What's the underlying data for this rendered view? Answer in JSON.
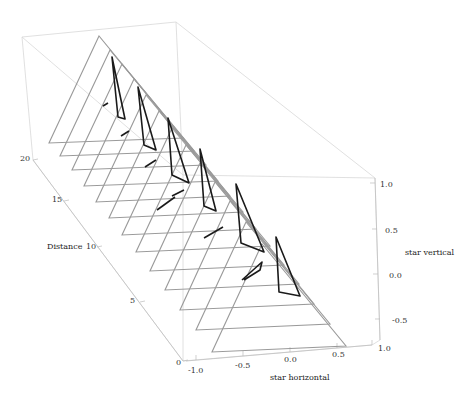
{
  "chart_data": {
    "type": "3d-line",
    "title": "",
    "axes": {
      "x": {
        "label": "star horizontal",
        "range": [
          -1.0,
          1.0
        ],
        "ticks": [
          "-1.0",
          "-0.5",
          "0.0",
          "0.5",
          "1.0"
        ]
      },
      "y": {
        "label": "Distance",
        "range": [
          0,
          20
        ],
        "ticks": [
          "0",
          "5",
          "10",
          "15",
          "20"
        ]
      },
      "z": {
        "label": "star vertical",
        "range": [
          -0.75,
          1.0
        ],
        "ticks": [
          "-0.5",
          "0.0",
          "0.5",
          "1.0"
        ]
      }
    },
    "series": [
      {
        "name": "reference triangles (gray)",
        "count": 12,
        "shape": "equilateral triangle",
        "distance_range": [
          1,
          20
        ]
      },
      {
        "name": "star paths (black)",
        "count": 6,
        "shape": "thin triangular loops with short tick segments"
      }
    ],
    "box": true,
    "grid": false,
    "legend": "none"
  },
  "labels": {
    "distance_axis": "Distance",
    "horizontal_axis": "star horizontal",
    "vertical_axis": "star vertical",
    "distance_ticks": [
      {
        "text": "20",
        "x": 20,
        "y": 154
      },
      {
        "text": "15",
        "x": 52,
        "y": 195
      },
      {
        "text": "10",
        "x": 86,
        "y": 242
      },
      {
        "text": "5",
        "x": 130,
        "y": 296
      },
      {
        "text": "0",
        "x": 176,
        "y": 358
      }
    ],
    "horizontal_ticks": [
      {
        "text": "-1.0",
        "x": 188,
        "y": 366
      },
      {
        "text": "-0.5",
        "x": 235,
        "y": 361
      },
      {
        "text": "0.0",
        "x": 284,
        "y": 355
      },
      {
        "text": "0.5",
        "x": 332,
        "y": 350
      },
      {
        "text": "1.0",
        "x": 378,
        "y": 344
      }
    ],
    "vertical_ticks": [
      {
        "text": "1.0",
        "x": 380,
        "y": 180
      },
      {
        "text": "0.5",
        "x": 385,
        "y": 226
      },
      {
        "text": "0.0",
        "x": 389,
        "y": 271
      },
      {
        "text": "-0.5",
        "x": 392,
        "y": 316
      }
    ]
  }
}
